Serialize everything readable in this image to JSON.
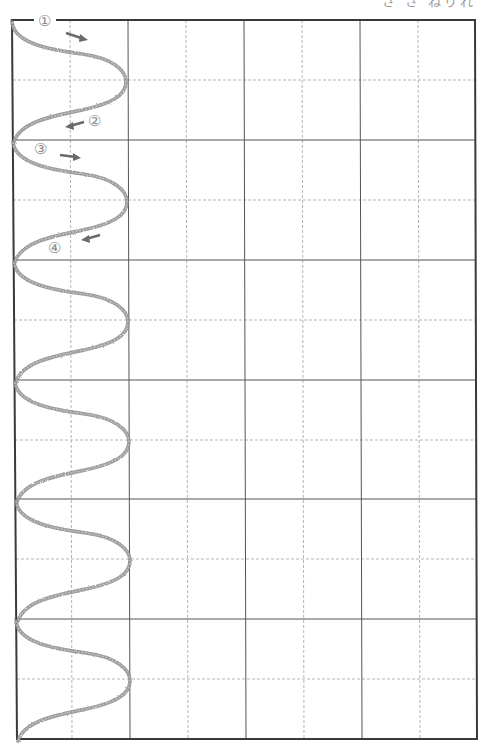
{
  "worksheet": {
    "header_text": "さ さ  ねりれ",
    "grid": {
      "rows": 6,
      "columns": 8,
      "border_color": "#3a3a3a",
      "solid_line_color": "#555555",
      "dashed_line_color": "#b5b5b5"
    },
    "stroke_color": "#8c8c8c",
    "trace_rows": 6,
    "stroke_order_markers": [
      {
        "label": "①",
        "direction": "right"
      },
      {
        "label": "②",
        "direction": "left"
      },
      {
        "label": "③",
        "direction": "right"
      },
      {
        "label": "④",
        "direction": "left"
      }
    ]
  }
}
